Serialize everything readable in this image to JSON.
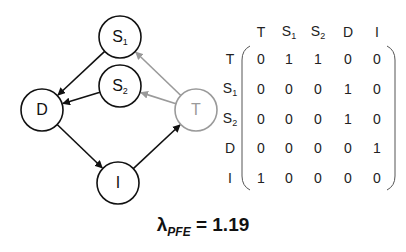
{
  "graph": {
    "nodes": [
      {
        "id": "S1",
        "base": "S",
        "sub": "1",
        "cx": 120,
        "cy": 37,
        "color": "#111111"
      },
      {
        "id": "S2",
        "base": "S",
        "sub": "2",
        "cx": 120,
        "cy": 86,
        "color": "#111111"
      },
      {
        "id": "D",
        "base": "D",
        "sub": "",
        "cx": 42,
        "cy": 110,
        "color": "#111111"
      },
      {
        "id": "I",
        "base": "I",
        "sub": "",
        "cx": 118,
        "cy": 183,
        "color": "#111111"
      },
      {
        "id": "T",
        "base": "T",
        "sub": "",
        "cx": 196,
        "cy": 110,
        "color": "#9a9a9a"
      }
    ],
    "edges": [
      {
        "from": "S1",
        "to": "D",
        "color": "#111111"
      },
      {
        "from": "S2",
        "to": "D",
        "color": "#111111"
      },
      {
        "from": "D",
        "to": "I",
        "color": "#111111"
      },
      {
        "from": "I",
        "to": "T",
        "color": "#111111"
      },
      {
        "from": "T",
        "to": "S1",
        "color": "#9a9a9a"
      },
      {
        "from": "T",
        "to": "S2",
        "color": "#9a9a9a"
      }
    ]
  },
  "matrix": {
    "col_headers": [
      {
        "base": "T",
        "sub": "",
        "gray": true
      },
      {
        "base": "S",
        "sub": "1",
        "gray": false
      },
      {
        "base": "S",
        "sub": "2",
        "gray": false
      },
      {
        "base": "D",
        "sub": "",
        "gray": false
      },
      {
        "base": "I",
        "sub": "",
        "gray": false
      }
    ],
    "row_headers": [
      {
        "base": "T",
        "sub": "",
        "gray": true
      },
      {
        "base": "S",
        "sub": "1",
        "gray": false
      },
      {
        "base": "S",
        "sub": "2",
        "gray": false
      },
      {
        "base": "D",
        "sub": "",
        "gray": false
      },
      {
        "base": "I",
        "sub": "",
        "gray": false
      }
    ],
    "values": [
      [
        0,
        1,
        1,
        0,
        0
      ],
      [
        0,
        0,
        0,
        1,
        0
      ],
      [
        0,
        0,
        0,
        1,
        0
      ],
      [
        0,
        0,
        0,
        0,
        1
      ],
      [
        1,
        0,
        0,
        0,
        0
      ]
    ]
  },
  "equation": {
    "symbol": "λ",
    "subscript": "PFE",
    "rest": " = 1.19"
  }
}
